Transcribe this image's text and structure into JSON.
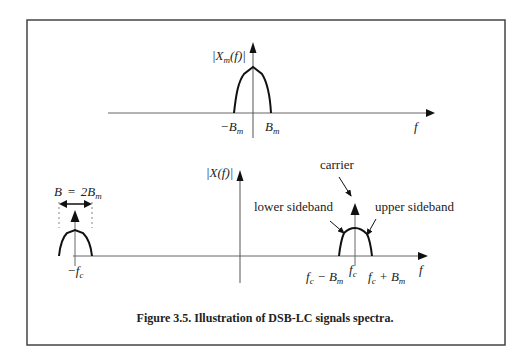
{
  "figure": {
    "caption": "Figure 3.5. Illustration of DSB-LC signals spectra.",
    "colors": {
      "frame": "#444444",
      "axis": "#555555",
      "curve": "#111111",
      "text": "#222222"
    }
  },
  "top_panel": {
    "y_label": "|X_m(f)|",
    "x_label": "f",
    "ticks": [
      {
        "id": "neg_bm",
        "label": "−B",
        "sub": "m"
      },
      {
        "id": "pos_bm",
        "label": "B",
        "sub": "m"
      }
    ],
    "curve": "baseband message spectrum (hump from -Bm to Bm)"
  },
  "bottom_panel": {
    "y_label": "|X(f)|",
    "x_label": "f",
    "bandwidth_label": {
      "lhs": "B",
      "eq": "=",
      "rhs": "2B",
      "sub": "m"
    },
    "annotations": {
      "carrier": "carrier",
      "lower_sideband": "lower sideband",
      "upper_sideband": "upper sideband"
    },
    "ticks": {
      "neg_fc": {
        "main": "−f",
        "sub": "c"
      },
      "fc": {
        "main": "f",
        "sub": "c"
      },
      "fc_minus_bm": {
        "main": "f",
        "sub": "c",
        "rest": " − B",
        "sub2": "m"
      },
      "fc_plus_bm": {
        "main": "f",
        "sub": "c",
        "rest": " + B",
        "sub2": "m"
      }
    }
  }
}
